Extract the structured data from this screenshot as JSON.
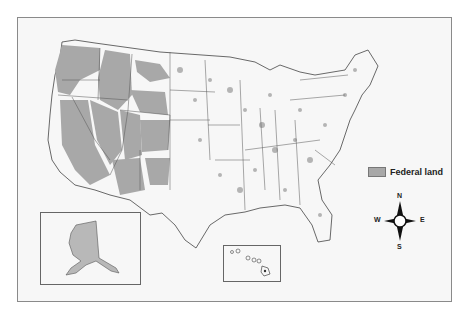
{
  "map": {
    "subject": "Federal land in the United States",
    "regions": [
      "Contiguous United States",
      "Alaska (inset)",
      "Hawaii (inset)"
    ]
  },
  "legend": {
    "items": [
      {
        "label": "Federal land",
        "color": "#a8a8a8"
      }
    ]
  },
  "compass": {
    "north": "N",
    "south": "S",
    "east": "E",
    "west": "W"
  },
  "colors": {
    "federal_land": "#a8a8a8",
    "background": "#f7f7f7",
    "border": "#555555"
  }
}
